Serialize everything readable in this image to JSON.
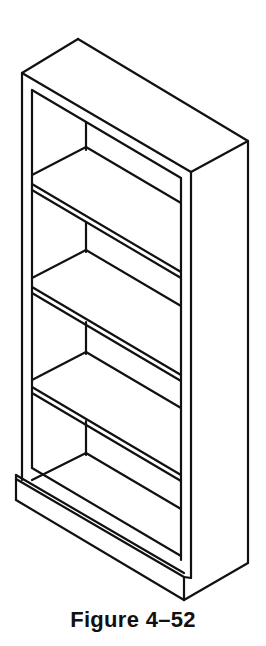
{
  "figure": {
    "caption": "Figure 4–52",
    "shelf_count": 4,
    "line_color": "#111111",
    "background": "#ffffff"
  },
  "geometry": {
    "segments": [
      [
        22,
        73,
        78,
        39
      ],
      [
        78,
        39,
        248,
        141
      ],
      [
        22,
        73,
        191,
        172
      ],
      [
        191,
        172,
        248,
        141
      ],
      [
        22,
        73,
        22,
        475
      ],
      [
        191,
        172,
        191,
        578
      ],
      [
        248,
        141,
        248,
        563
      ],
      [
        32,
        90,
        32,
        468
      ],
      [
        32,
        90,
        181,
        178
      ],
      [
        181,
        178,
        181,
        560
      ],
      [
        32,
        184,
        181,
        272
      ],
      [
        32,
        190,
        181,
        278
      ],
      [
        32,
        287,
        181,
        375
      ],
      [
        32,
        293,
        181,
        381
      ],
      [
        32,
        387,
        181,
        475
      ],
      [
        32,
        393,
        181,
        481
      ],
      [
        32,
        468,
        181,
        556
      ],
      [
        86,
        122,
        86,
        150
      ],
      [
        32,
        175,
        86,
        147
      ],
      [
        86,
        147,
        181,
        203
      ],
      [
        86,
        222,
        86,
        252
      ],
      [
        32,
        278,
        86,
        250
      ],
      [
        86,
        250,
        181,
        306
      ],
      [
        86,
        322,
        86,
        354
      ],
      [
        32,
        380,
        86,
        352
      ],
      [
        86,
        352,
        181,
        408
      ],
      [
        86,
        421,
        86,
        455
      ],
      [
        32,
        480,
        86,
        453
      ],
      [
        86,
        453,
        181,
        509
      ],
      [
        16,
        475,
        184,
        573
      ],
      [
        16,
        479,
        184,
        577
      ],
      [
        22,
        475,
        22,
        480
      ],
      [
        16,
        475,
        16,
        500
      ],
      [
        16,
        500,
        184,
        600
      ],
      [
        184,
        577,
        184,
        600
      ],
      [
        184,
        600,
        248,
        563
      ],
      [
        191,
        578,
        184,
        577
      ]
    ]
  }
}
